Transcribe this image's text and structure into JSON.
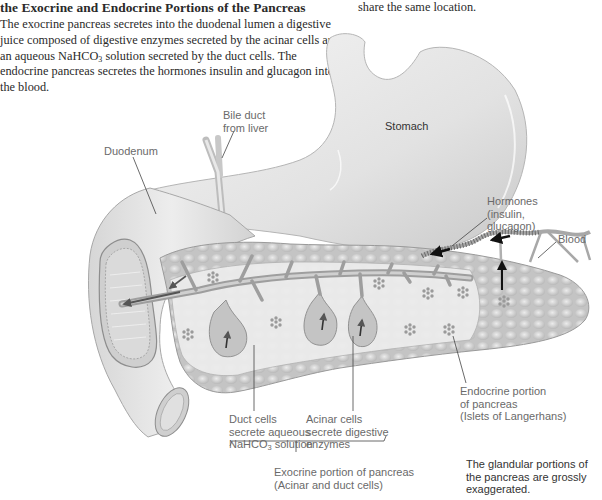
{
  "caption": {
    "title": "the Exocrine and Endocrine Portions of the Pancreas",
    "body_part1": "The exocrine pancreas secretes into the duodenal lumen a digestive juice composed of digestive enzymes secreted by the acinar cells and an aqueous NaHCO",
    "body_sub": "3",
    "body_part2": " solution secreted by the duct cells. The endocrine pancreas secretes the hormones insulin and glucagon into the blood.",
    "right_fragment": "share the same location."
  },
  "labels": {
    "bile_duct": [
      "Bile duct",
      "from liver"
    ],
    "stomach": "Stomach",
    "duodenum": "Duodenum",
    "hormones": [
      "Hormones",
      "(insulin,",
      "glucagon)"
    ],
    "blood": "Blood",
    "endocrine": [
      "Endocrine portion",
      "of pancreas",
      "(Islets of Langerhans)"
    ],
    "duct_cells": {
      "line1": "Duct cells",
      "line2": "secrete aqueous",
      "line3_pre": "NaHCO",
      "line3_sub": "3",
      "line3_post": " solution"
    },
    "acinar_cells": [
      "Acinar cells",
      "secrete digestive",
      "enzymes"
    ],
    "exocrine": [
      "Exocrine portion of pancreas",
      "(Acinar and duct cells)"
    ],
    "note": [
      "The glandular portions of",
      "the pancreas are grossly",
      "exaggerated."
    ]
  },
  "colors": {
    "organ_fill": "#e6e6e6",
    "organ_shade": "#c8c8c8",
    "pancreas_fill": "#cfcfcf",
    "pancreas_lobule": "#dedede",
    "duct": "#a0a0a0",
    "arrow": "#555555",
    "blood_vessel": "#9a9a9a",
    "label_text": "#6a6a6a",
    "leader_line": "#444444"
  }
}
